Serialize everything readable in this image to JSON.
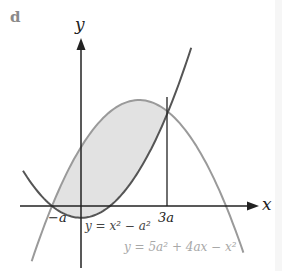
{
  "figure": {
    "panel_label": "d",
    "axes": {
      "x_label": "x",
      "y_label": "y"
    },
    "ticks": {
      "neg_a": "−a",
      "three_a": "3a"
    },
    "curves": [
      {
        "name": "parabola-upward",
        "equation": "y = x² − a²",
        "color": "#555555"
      },
      {
        "name": "parabola-downward",
        "equation": "y = 5a² + 4ax − x²",
        "color": "#9a9a9a"
      }
    ],
    "shaded_region": {
      "fill": "#e2e2e2",
      "between_x": [
        "−a",
        "3a"
      ]
    }
  }
}
